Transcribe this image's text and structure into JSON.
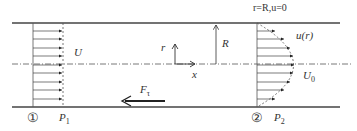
{
  "diagram": {
    "labels": {
      "boundary": "r=R,u=0",
      "uniform_velocity": "U",
      "profile": "u(r)",
      "center_velocity": "U",
      "center_velocity_sub": "0",
      "radius": "R",
      "r_axis": "r",
      "x_axis": "x",
      "force": "F",
      "force_sub": "τ",
      "section1": "①",
      "section2": "②",
      "p1": "P",
      "p1_sub": "1",
      "p2": "P",
      "p2_sub": "2"
    },
    "colors": {
      "line": "#444444",
      "text": "#333333"
    }
  }
}
